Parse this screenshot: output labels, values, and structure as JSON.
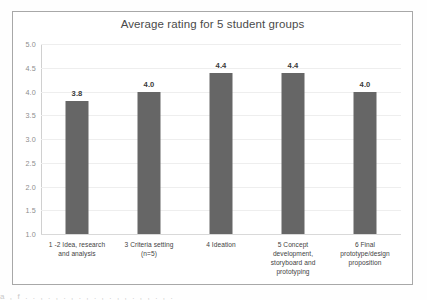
{
  "chart_data": {
    "type": "bar",
    "title": "Average rating for 5 student groups",
    "xlabel": "",
    "ylabel": "",
    "ylim": [
      1.0,
      5.0
    ],
    "ytick_step": 0.5,
    "yticks": [
      "5.0",
      "4.5",
      "4.0",
      "3.5",
      "3.0",
      "2.5",
      "2.0",
      "1.5",
      "1.0"
    ],
    "grid": true,
    "legend": "none",
    "bar_color": "#666666",
    "categories": [
      "1 -2 Idea, research and analysis",
      "3 Criteria setting (n=5)",
      "4 Ideation",
      "5 Concept development, storyboard and prototyping",
      "6 Final prototype/design proposition"
    ],
    "category_lines": [
      [
        "1 -2 Idea, research",
        "and analysis"
      ],
      [
        "3 Criteria setting",
        "(n=5)"
      ],
      [
        "4 Ideation"
      ],
      [
        "5 Concept",
        "development,",
        "storyboard and",
        "prototyping"
      ],
      [
        "6 Final",
        "prototype/design",
        "proposition"
      ]
    ],
    "values": [
      3.8,
      4.0,
      4.4,
      4.4,
      4.0
    ],
    "value_labels": [
      "3.8",
      "4.0",
      "4.4",
      "4.4",
      "4.0"
    ]
  },
  "page": {
    "clipped_text": "a  ,  f  .  .  ,  .  ,  .  ,  .  ,  .  ,  .  ,  ,  .  ,  ,  .  ,  ."
  }
}
